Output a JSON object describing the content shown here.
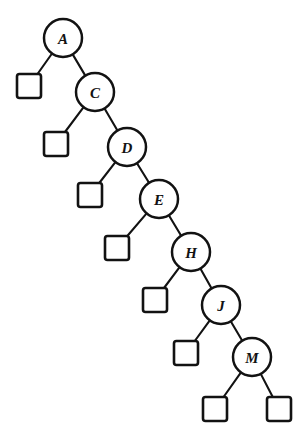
{
  "diagram": {
    "type": "binary-tree",
    "style": {
      "background_color": "#ffffff",
      "stroke_color": "#121212",
      "node_fill": "#ffffff",
      "node_radius": 19,
      "leaf_size": 24,
      "edge_width": 2.1
    },
    "nodes": [
      {
        "id": "A",
        "label": "A",
        "cx": 63,
        "cy": 38
      },
      {
        "id": "C",
        "label": "C",
        "cx": 95,
        "cy": 92
      },
      {
        "id": "D",
        "label": "D",
        "cx": 127,
        "cy": 147
      },
      {
        "id": "E",
        "label": "E",
        "cx": 159,
        "cy": 199
      },
      {
        "id": "H",
        "label": "H",
        "cx": 191,
        "cy": 252
      },
      {
        "id": "J",
        "label": "J",
        "cx": 221,
        "cy": 305
      },
      {
        "id": "M",
        "label": "M",
        "cx": 252,
        "cy": 357
      }
    ],
    "leaves": [
      {
        "id": "leaf-A-left",
        "parent": "A",
        "side": "left",
        "x": 17,
        "y": 74
      },
      {
        "id": "leaf-C-left",
        "parent": "C",
        "side": "left",
        "x": 44,
        "y": 132
      },
      {
        "id": "leaf-D-left",
        "parent": "D",
        "side": "left",
        "x": 78,
        "y": 183
      },
      {
        "id": "leaf-E-left",
        "parent": "E",
        "side": "left",
        "x": 105,
        "y": 236
      },
      {
        "id": "leaf-H-left",
        "parent": "H",
        "side": "left",
        "x": 143,
        "y": 288
      },
      {
        "id": "leaf-J-left",
        "parent": "J",
        "side": "left",
        "x": 174,
        "y": 341
      },
      {
        "id": "leaf-M-left",
        "parent": "M",
        "side": "left",
        "x": 203,
        "y": 397
      },
      {
        "id": "leaf-M-right",
        "parent": "M",
        "side": "right",
        "x": 267,
        "y": 397
      }
    ],
    "edges": [
      {
        "from": "A",
        "to": "leaf-A-left",
        "kind": "left-child"
      },
      {
        "from": "A",
        "to": "C",
        "kind": "right-child"
      },
      {
        "from": "C",
        "to": "leaf-C-left",
        "kind": "left-child"
      },
      {
        "from": "C",
        "to": "D",
        "kind": "right-child"
      },
      {
        "from": "D",
        "to": "leaf-D-left",
        "kind": "left-child"
      },
      {
        "from": "D",
        "to": "E",
        "kind": "right-child"
      },
      {
        "from": "E",
        "to": "leaf-E-left",
        "kind": "left-child"
      },
      {
        "from": "E",
        "to": "H",
        "kind": "right-child"
      },
      {
        "from": "H",
        "to": "leaf-H-left",
        "kind": "left-child"
      },
      {
        "from": "H",
        "to": "J",
        "kind": "right-child"
      },
      {
        "from": "J",
        "to": "leaf-J-left",
        "kind": "left-child"
      },
      {
        "from": "J",
        "to": "M",
        "kind": "right-child"
      },
      {
        "from": "M",
        "to": "leaf-M-left",
        "kind": "left-child"
      },
      {
        "from": "M",
        "to": "leaf-M-right",
        "kind": "right-child"
      }
    ]
  }
}
